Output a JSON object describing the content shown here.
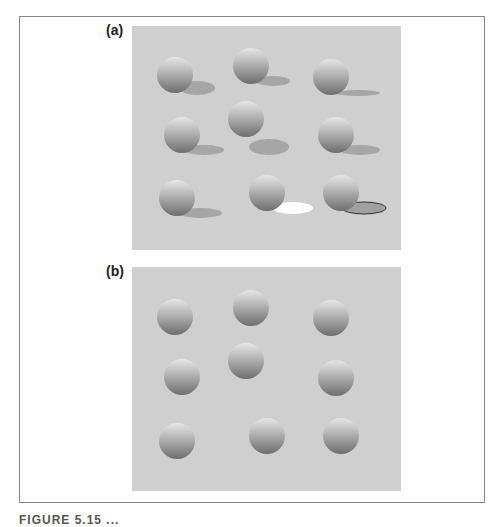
{
  "figure": {
    "panels": [
      {
        "label": "(a)",
        "description": "Spheres with cast shadows",
        "spheres": [
          {
            "cx": 43,
            "cy": 49,
            "r": 18,
            "shadow": {
              "cx": 65,
              "cy": 62,
              "rx": 18,
              "ry": 7,
              "fill": "#a6a6a6",
              "stroke": "none"
            }
          },
          {
            "cx": 119,
            "cy": 40,
            "r": 18,
            "shadow": {
              "cx": 141,
              "cy": 55,
              "rx": 17,
              "ry": 5,
              "fill": "#a6a6a6",
              "stroke": "none"
            }
          },
          {
            "cx": 199,
            "cy": 51,
            "r": 18,
            "shadow": {
              "cx": 226,
              "cy": 67,
              "rx": 22,
              "ry": 3,
              "fill": "#a6a6a6",
              "stroke": "none"
            }
          },
          {
            "cx": 50,
            "cy": 109,
            "r": 18,
            "shadow": {
              "cx": 72,
              "cy": 124,
              "rx": 20,
              "ry": 5,
              "fill": "#a6a6a6",
              "stroke": "none"
            }
          },
          {
            "cx": 114,
            "cy": 93,
            "r": 18,
            "shadow": {
              "cx": 137,
              "cy": 121,
              "rx": 20,
              "ry": 8,
              "fill": "#a6a6a6",
              "stroke": "none"
            }
          },
          {
            "cx": 204,
            "cy": 109,
            "r": 18,
            "shadow": {
              "cx": 228,
              "cy": 124,
              "rx": 20,
              "ry": 5,
              "fill": "#a6a6a6",
              "stroke": "none"
            }
          },
          {
            "cx": 45,
            "cy": 172,
            "r": 18,
            "shadow": {
              "cx": 68,
              "cy": 187,
              "rx": 22,
              "ry": 5,
              "fill": "#a6a6a6",
              "stroke": "none"
            }
          },
          {
            "cx": 135,
            "cy": 167,
            "r": 18,
            "shadow": {
              "cx": 161,
              "cy": 182,
              "rx": 20,
              "ry": 6,
              "fill": "#ffffff",
              "stroke": "none"
            }
          },
          {
            "cx": 209,
            "cy": 167,
            "r": 18,
            "shadow": {
              "cx": 232,
              "cy": 182,
              "rx": 22,
              "ry": 6,
              "fill": "#a0a0a0",
              "stroke": "#333333"
            }
          }
        ]
      },
      {
        "label": "(b)",
        "description": "Same spheres without shadows",
        "spheres": [
          {
            "cx": 43,
            "cy": 50,
            "r": 18
          },
          {
            "cx": 119,
            "cy": 41,
            "r": 18
          },
          {
            "cx": 199,
            "cy": 51,
            "r": 18
          },
          {
            "cx": 50,
            "cy": 110,
            "r": 18
          },
          {
            "cx": 114,
            "cy": 94,
            "r": 18
          },
          {
            "cx": 204,
            "cy": 111,
            "r": 18
          },
          {
            "cx": 45,
            "cy": 174,
            "r": 18
          },
          {
            "cx": 135,
            "cy": 169,
            "r": 18
          },
          {
            "cx": 209,
            "cy": 169,
            "r": 18
          }
        ]
      }
    ],
    "caption_partial": "FIGURE 5.15  ...",
    "colors": {
      "panel_bg": "#cfcfcf",
      "sphere_light": "#e6e6e6",
      "sphere_dark": "#6e6e6e",
      "frame": "#8a8a8a"
    }
  }
}
